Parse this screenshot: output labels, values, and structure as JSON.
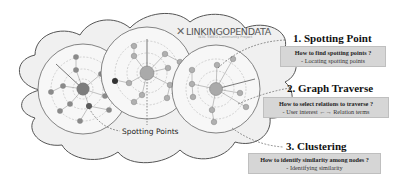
{
  "logo": {
    "mark": "✕",
    "text": "LINKINGOPENDATA",
    "subtitle": "W3C SWEO Community Project"
  },
  "annotation": {
    "spotting_points_label": "Spotting Points"
  },
  "steps": [
    {
      "title": "1. Spotting Point",
      "question": "How to find spotting points ?",
      "answer": "- Locating spotting points"
    },
    {
      "title": "2. Graph Traverse",
      "question": "How to select relations to traverse ?",
      "answer": "- User interest  ←→  Relation terms"
    },
    {
      "title": "3. Clustering",
      "question": "How to identify similarity among nodes ?",
      "answer": "- Identifying similarity"
    }
  ],
  "colors": {
    "cloud_fill": "#f0f0f0",
    "cloud_stroke": "#555555",
    "circle_fill": "#f7f7f7",
    "node_fill": "#8a8a8a",
    "node_light": "#b8b8b8",
    "bridge_node": "#333333",
    "box_fill": "#d6d6d6"
  }
}
